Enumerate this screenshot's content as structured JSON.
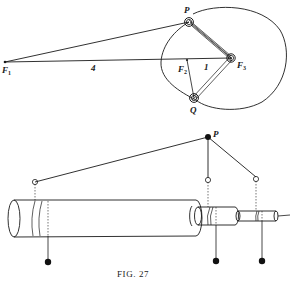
{
  "figure": {
    "caption": "FIG. 27",
    "top_diagram": {
      "foci": [
        {
          "name": "F",
          "sub": "1"
        },
        {
          "name": "F",
          "sub": "2"
        },
        {
          "name": "F",
          "sub": "3"
        }
      ],
      "points": {
        "p": "P",
        "q": "Q"
      },
      "distances": {
        "f1_f2": "4",
        "f2_f3": "1"
      }
    },
    "bottom_diagram": {
      "point": "P"
    }
  }
}
